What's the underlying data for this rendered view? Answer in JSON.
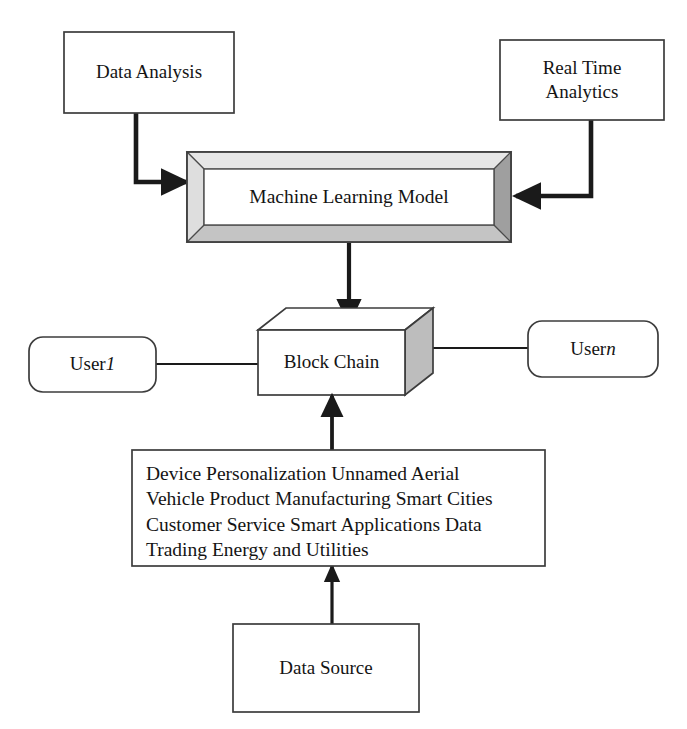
{
  "diagram": {
    "background_color": "#ffffff",
    "line_color": "#1a1a1a",
    "bevel_light_color": "#d8d8d8",
    "bevel_mid_color": "#c0c0c0",
    "bevel_dark_color": "#9a9a9a",
    "cube_side_color": "#bdbdbd",
    "cube_top_color": "#ffffff"
  },
  "nodes": {
    "data_analysis": {
      "label": "Data Analysis",
      "shape": "rectangle"
    },
    "real_time_analytics": {
      "label": "Real Time\nAnalytics",
      "shape": "rectangle"
    },
    "machine_learning_model": {
      "label": "Machine Learning Model",
      "shape": "beveled-frame-3d"
    },
    "block_chain": {
      "label": "Block Chain",
      "shape": "cube-3d"
    },
    "user_first": {
      "label_prefix": "User ",
      "label_index": "1",
      "shape": "rounded-rectangle"
    },
    "user_nth": {
      "label_prefix": "User ",
      "label_index": "n",
      "shape": "rounded-rectangle"
    },
    "applications": {
      "shape": "rectangle",
      "lines": [
        "Device Personalization Unnamed Aerial",
        "Vehicle Product Manufacturing Smart Cities",
        "Customer Service Smart Applications Data",
        "Trading Energy and Utilities"
      ],
      "text": "Device Personalization Unnamed Aerial\nVehicle Product Manufacturing Smart Cities\nCustomer Service Smart Applications Data\nTrading Energy and Utilities"
    },
    "data_source": {
      "label": "Data Source",
      "shape": "rectangle"
    }
  },
  "connectors": [
    {
      "name": "data-analysis-to-ml",
      "from": "data_analysis",
      "to": "machine_learning_model",
      "style": "elbow-arrow",
      "arrowhead": "end"
    },
    {
      "name": "real-time-analytics-to-ml",
      "from": "real_time_analytics",
      "to": "machine_learning_model",
      "style": "elbow-arrow",
      "arrowhead": "end"
    },
    {
      "name": "ml-to-block-chain",
      "from": "machine_learning_model",
      "to": "block_chain",
      "style": "straight-arrow-down",
      "arrowhead": "end"
    },
    {
      "name": "user-first-to-block-chain",
      "from": "user_first",
      "to": "block_chain",
      "style": "plain-line",
      "arrowhead": "none"
    },
    {
      "name": "block-chain-to-user-nth",
      "from": "block_chain",
      "to": "user_nth",
      "style": "plain-line",
      "arrowhead": "none"
    },
    {
      "name": "applications-to-block-chain",
      "from": "applications",
      "to": "block_chain",
      "style": "straight-arrow-up",
      "arrowhead": "end"
    },
    {
      "name": "data-source-to-applications",
      "from": "data_source",
      "to": "applications",
      "style": "straight-arrow-up",
      "arrowhead": "end"
    }
  ]
}
